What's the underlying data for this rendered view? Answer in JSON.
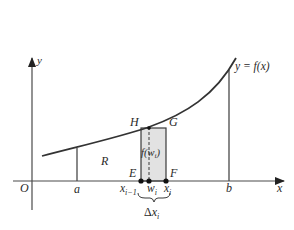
{
  "diagram": {
    "type": "riemann-sum-rectangle",
    "colors": {
      "line": "#3a3a3a",
      "axis": "#4a4a4a",
      "rect_fill": "#e2e2e2",
      "text": "#2a2a2a",
      "background": "#ffffff"
    },
    "axes": {
      "x_label": "x",
      "y_label": "y",
      "origin_label": "O"
    },
    "curve": {
      "label": "y = f(x)"
    },
    "bounds": {
      "a_label": "a",
      "b_label": "b"
    },
    "region": {
      "label": "R"
    },
    "rectangle": {
      "corners": {
        "E": "E",
        "F": "F",
        "G": "G",
        "H": "H"
      },
      "height_label_f": "f(w",
      "height_label_sub": "i",
      "height_label_close": ")"
    },
    "points": {
      "x_prev": "x",
      "x_prev_sub": "i−1",
      "w": "w",
      "w_sub": "i",
      "x_curr": "x",
      "x_curr_sub": "i"
    },
    "width": {
      "delta": "Δ",
      "x": "x",
      "sub": "i"
    }
  }
}
